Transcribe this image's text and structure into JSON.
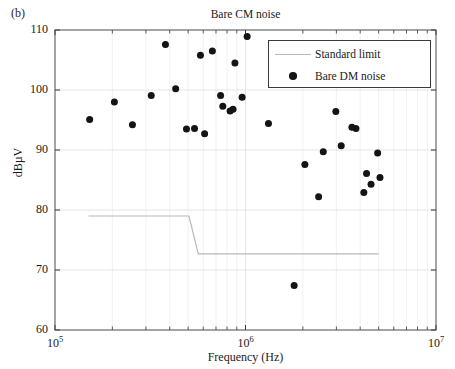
{
  "panel_label": "(b)",
  "chart_data": {
    "type": "scatter",
    "title": "Bare CM noise",
    "xlabel": "Frequency (Hz)",
    "ylabel": "dBµV",
    "xscale": "log",
    "xlim": [
      100000,
      10000000
    ],
    "ylim": [
      60,
      110
    ],
    "yticks": [
      60,
      70,
      80,
      90,
      100,
      110
    ],
    "ytick_labels": [
      "60",
      "70",
      "80",
      "90",
      "100",
      "110"
    ],
    "xticks": [
      100000,
      1000000,
      10000000
    ],
    "xtick_labels": [
      "10⁵",
      "10⁶",
      "10⁷"
    ],
    "grid": true,
    "legend_position": "upper right",
    "marker_color": "#141414",
    "line_color": "#b9b9b9",
    "series": [
      {
        "name": "Standard limit",
        "type": "line",
        "color": "#b9b9b9",
        "x": [
          150000,
          505000,
          565000,
          5000000
        ],
        "y": [
          79.0,
          79.0,
          72.7,
          72.7
        ]
      },
      {
        "name": "Bare DM noise",
        "type": "scatter",
        "color": "#141414",
        "points": [
          [
            152000,
            95.1
          ],
          [
            205000,
            98.0
          ],
          [
            255000,
            94.2
          ],
          [
            320000,
            99.1
          ],
          [
            380000,
            107.6
          ],
          [
            430000,
            100.2
          ],
          [
            490000,
            93.5
          ],
          [
            540000,
            93.6
          ],
          [
            580000,
            105.8
          ],
          [
            610000,
            92.7
          ],
          [
            670000,
            106.5
          ],
          [
            740000,
            99.1
          ],
          [
            760000,
            97.3
          ],
          [
            830000,
            96.5
          ],
          [
            860000,
            96.8
          ],
          [
            880000,
            104.5
          ],
          [
            960000,
            98.8
          ],
          [
            1020000,
            108.9
          ],
          [
            1320000,
            94.4
          ],
          [
            1620000,
            102.9
          ],
          [
            1680000,
            100.9
          ],
          [
            1800000,
            67.4
          ],
          [
            2050000,
            87.6
          ],
          [
            2420000,
            82.2
          ],
          [
            2560000,
            89.7
          ],
          [
            2980000,
            96.4
          ],
          [
            3180000,
            90.7
          ],
          [
            3620000,
            93.8
          ],
          [
            3800000,
            93.6
          ],
          [
            4180000,
            82.9
          ],
          [
            4320000,
            86.1
          ],
          [
            4560000,
            84.3
          ],
          [
            4940000,
            89.5
          ],
          [
            5080000,
            85.4
          ]
        ]
      }
    ]
  }
}
